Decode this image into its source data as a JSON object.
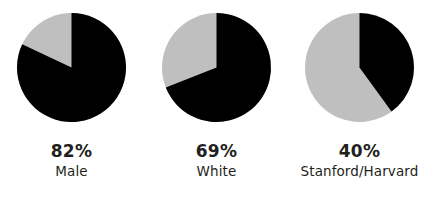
{
  "figure": {
    "background_color": "#FFFFFF",
    "width": 429,
    "height": 209
  },
  "palette": {
    "primary": "#000000",
    "remainder": "#BFBFBF",
    "text": "#231F20"
  },
  "charts": [
    {
      "percent_label": "82%",
      "category_label": "Male",
      "value": 82,
      "remainder": 18
    },
    {
      "percent_label": "69%",
      "category_label": "White",
      "value": 69,
      "remainder": 31
    },
    {
      "percent_label": "40%",
      "category_label": "Stanford/Harvard",
      "value": 40,
      "remainder": 60
    }
  ],
  "chart_data": {
    "type": "pie",
    "title": "",
    "subtitle": "",
    "xlabel": "",
    "ylabel": "",
    "grid": false,
    "legend": "none",
    "start_angle_deg": 90,
    "direction": "clockwise",
    "panels": [
      {
        "name": "Male",
        "data_label": "82%",
        "labels": [
          "Male",
          "Other"
        ],
        "values": [
          82,
          18
        ],
        "colors": [
          "#000000",
          "#BFBFBF"
        ]
      },
      {
        "name": "White",
        "data_label": "69%",
        "labels": [
          "White",
          "Other"
        ],
        "values": [
          69,
          31
        ],
        "colors": [
          "#000000",
          "#BFBFBF"
        ]
      },
      {
        "name": "Stanford/Harvard",
        "data_label": "40%",
        "labels": [
          "Stanford/Harvard",
          "Other"
        ],
        "values": [
          40,
          60
        ],
        "colors": [
          "#000000",
          "#BFBFBF"
        ]
      }
    ]
  }
}
